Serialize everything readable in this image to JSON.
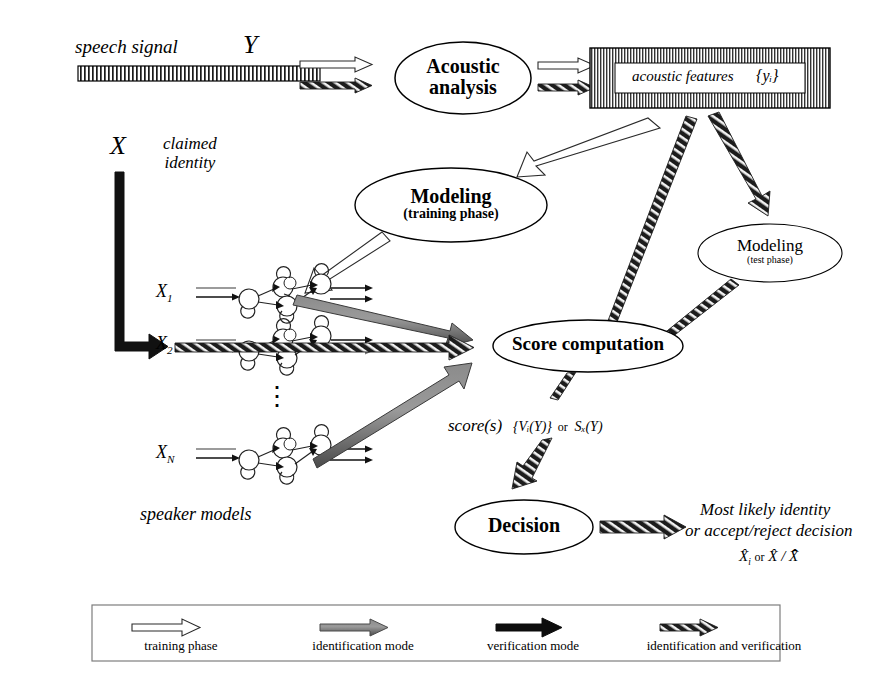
{
  "figure": {
    "type": "flow-diagram",
    "background": "#ffffff",
    "ink": "#000000"
  },
  "signal": {
    "label": "speech signal",
    "symbol": "Y"
  },
  "features": {
    "label": "acoustic features",
    "symbol": "{yᵢ}"
  },
  "identity": {
    "symbol": "X",
    "label_line1": "claimed",
    "label_line2": "identity"
  },
  "nodes": {
    "acoustic_analysis": {
      "line1": "Acoustic",
      "line2": "analysis"
    },
    "modeling_training": {
      "line1": "Modeling",
      "line2": "(training phase)"
    },
    "modeling_test": {
      "line1": "Modeling",
      "line2": "(test phase)"
    },
    "score_computation": {
      "line1": "Score computation"
    },
    "decision": {
      "line1": "Decision"
    }
  },
  "speaker_models": {
    "caption": "speaker models",
    "items": [
      {
        "label": "X",
        "index": "1"
      },
      {
        "label": "X",
        "index": "2"
      },
      {
        "label": "X",
        "index": "N"
      }
    ],
    "ellipsis": "⋮"
  },
  "score_output": {
    "prefix": "score(s)",
    "expr_a": "{Vᵢ(Y)}",
    "joiner": "or",
    "expr_b": "Sₓ(Y)"
  },
  "decision_output": {
    "line1": "Most likely identity",
    "line2": "or accept/reject decision",
    "line3_a": "X̂",
    "line3_a_sub": "i",
    "line3_joiner": "or",
    "line3_b": "X̂ / X̄̂"
  },
  "legend": {
    "items": [
      {
        "label": "training phase",
        "style": "hollow",
        "color": "#ffffff"
      },
      {
        "label": "identification mode",
        "style": "gray",
        "color": "#6e6e6e"
      },
      {
        "label": "verification mode",
        "style": "black",
        "color": "#000000"
      },
      {
        "label": "identification and verification",
        "style": "hatched",
        "color": "#2a2a2a"
      }
    ]
  }
}
